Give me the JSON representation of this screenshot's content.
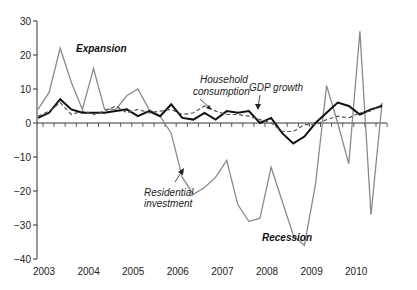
{
  "chart_data": {
    "type": "line",
    "title": "",
    "xlabel": "",
    "ylabel": "",
    "ylim": [
      -40,
      30
    ],
    "yticks": [
      -40,
      -30,
      -20,
      -10,
      0,
      10,
      20,
      30
    ],
    "xtick_labels": [
      "2003",
      "2004",
      "2005",
      "2006",
      "2007",
      "2008",
      "2009",
      "2010"
    ],
    "grid": false,
    "legend": "inline annotations",
    "x": [
      "2003Q1",
      "2003Q2",
      "2003Q3",
      "2003Q4",
      "2004Q1",
      "2004Q2",
      "2004Q3",
      "2004Q4",
      "2005Q1",
      "2005Q2",
      "2005Q3",
      "2005Q4",
      "2006Q1",
      "2006Q2",
      "2006Q3",
      "2006Q4",
      "2007Q1",
      "2007Q2",
      "2007Q3",
      "2007Q4",
      "2008Q1",
      "2008Q2",
      "2008Q3",
      "2008Q4",
      "2009Q1",
      "2009Q2",
      "2009Q3",
      "2009Q4",
      "2010Q1",
      "2010Q2",
      "2010Q3",
      "2010Q4"
    ],
    "series": [
      {
        "name": "Residential investment",
        "style": "solid-gray",
        "color": "#8a8a8a",
        "values": [
          4,
          9,
          22,
          12,
          4,
          16,
          4,
          4,
          8,
          10,
          4,
          2,
          -3,
          -16,
          -21,
          -19,
          -16,
          -11,
          -24,
          -29,
          -28,
          -13,
          -23,
          -33,
          -36,
          -18,
          11,
          0,
          -12,
          27,
          -27,
          6
        ]
      },
      {
        "name": "GDP growth",
        "style": "solid-black-thick",
        "color": "#111111",
        "values": [
          1.5,
          3,
          7,
          4,
          3,
          3,
          3,
          3.5,
          4,
          2,
          3.5,
          2,
          5.5,
          1.5,
          1,
          3,
          1,
          3.5,
          3,
          3.5,
          0,
          1.5,
          -3,
          -6,
          -4,
          0,
          3,
          6,
          5,
          2.5,
          4,
          5
        ]
      },
      {
        "name": "Household consumption",
        "style": "dashed-gray",
        "color": "#555555",
        "values": [
          2,
          3.5,
          6,
          2.5,
          3.5,
          2.5,
          3.5,
          5,
          3,
          4,
          3,
          3.5,
          4,
          2.5,
          3,
          5,
          3.5,
          2.5,
          2.5,
          2,
          1,
          0,
          -2.5,
          -2.5,
          -0.5,
          -0.5,
          1,
          2,
          1.5,
          3,
          3.5,
          5.5
        ]
      }
    ],
    "annotations": [
      {
        "text": "Expansion",
        "bold": true,
        "italic": true
      },
      {
        "text": "Household consumption",
        "lines": [
          "Household",
          "consumption"
        ],
        "italic": true
      },
      {
        "text": "GDP growth",
        "italic": true
      },
      {
        "text": "Residential investment",
        "lines": [
          "Residential",
          "investment"
        ],
        "italic": true
      },
      {
        "text": "Recession",
        "bold": true,
        "italic": true
      }
    ]
  },
  "labels": {
    "expansion": "Expansion",
    "household_1": "Household",
    "household_2": "consumption",
    "gdp": "GDP growth",
    "residential_1": "Residential",
    "residential_2": "investment",
    "recession": "Recession"
  }
}
